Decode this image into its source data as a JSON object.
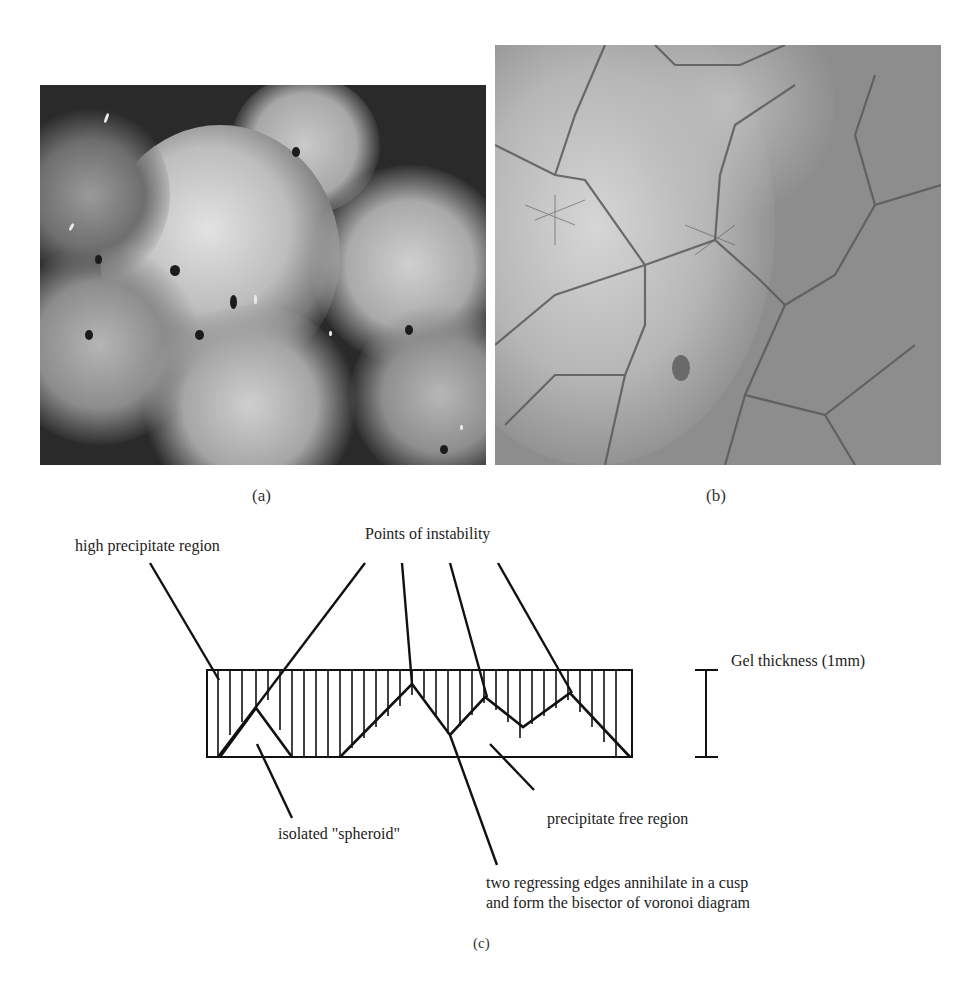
{
  "figure": {
    "panels": [
      {
        "id": "a",
        "caption": "(a)",
        "description": "grayscale micrograph of bright spheroidal precipitate domains separated by dark boundaries"
      },
      {
        "id": "b",
        "caption": "(b)",
        "description": "grayscale micrograph of polygonal Voronoi-like cell network"
      },
      {
        "id": "c",
        "caption": "(c)",
        "description": "schematic cross-section of gel showing precipitate regions"
      }
    ],
    "diagram": {
      "labels": {
        "high_precipitate": "high precipitate region",
        "points_of_instability": "Points of instability",
        "gel_thickness": "Gel thickness (1mm)",
        "isolated_spheroid": "isolated \"spheroid\"",
        "precipitate_free": "precipitate free region",
        "cusp_line1": "two regressing edges annihilate in a cusp",
        "cusp_line2": "and form the bisector of voronoi diagram"
      }
    }
  }
}
